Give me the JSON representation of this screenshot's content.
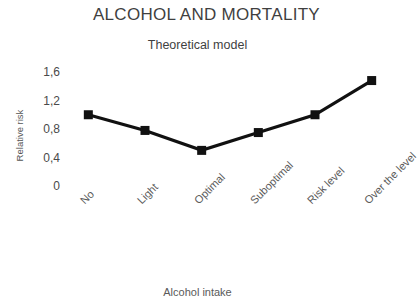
{
  "chart_data": {
    "type": "line",
    "title": "ALCOHOL AND MORTALITY",
    "subtitle": "Theoretical model",
    "xlabel": "Alcohol intake",
    "ylabel": "Relative risk",
    "categories": [
      "No",
      "Light",
      "Optimal",
      "Suboptimal",
      "Risk level",
      "Over the level"
    ],
    "values": [
      1.0,
      0.78,
      0.5,
      0.75,
      1.0,
      1.48
    ],
    "ylim": [
      0,
      1.6
    ],
    "ytick_labels": [
      "1,6",
      "1,2",
      "0,8",
      "0,4",
      "0"
    ],
    "ytick_values": [
      1.6,
      1.2,
      0.8,
      0.4,
      0
    ],
    "grid": false,
    "legend": "none",
    "series": [
      {
        "name": "Relative risk",
        "values": [
          1.0,
          0.78,
          0.5,
          0.75,
          1.0,
          1.48
        ]
      }
    ],
    "marker": "square",
    "colors": {
      "line": "#111111",
      "marker": "#111111",
      "title_text": "#3f3f3f",
      "axis_text": "#4a4a4a",
      "background": "#ffffff"
    }
  }
}
